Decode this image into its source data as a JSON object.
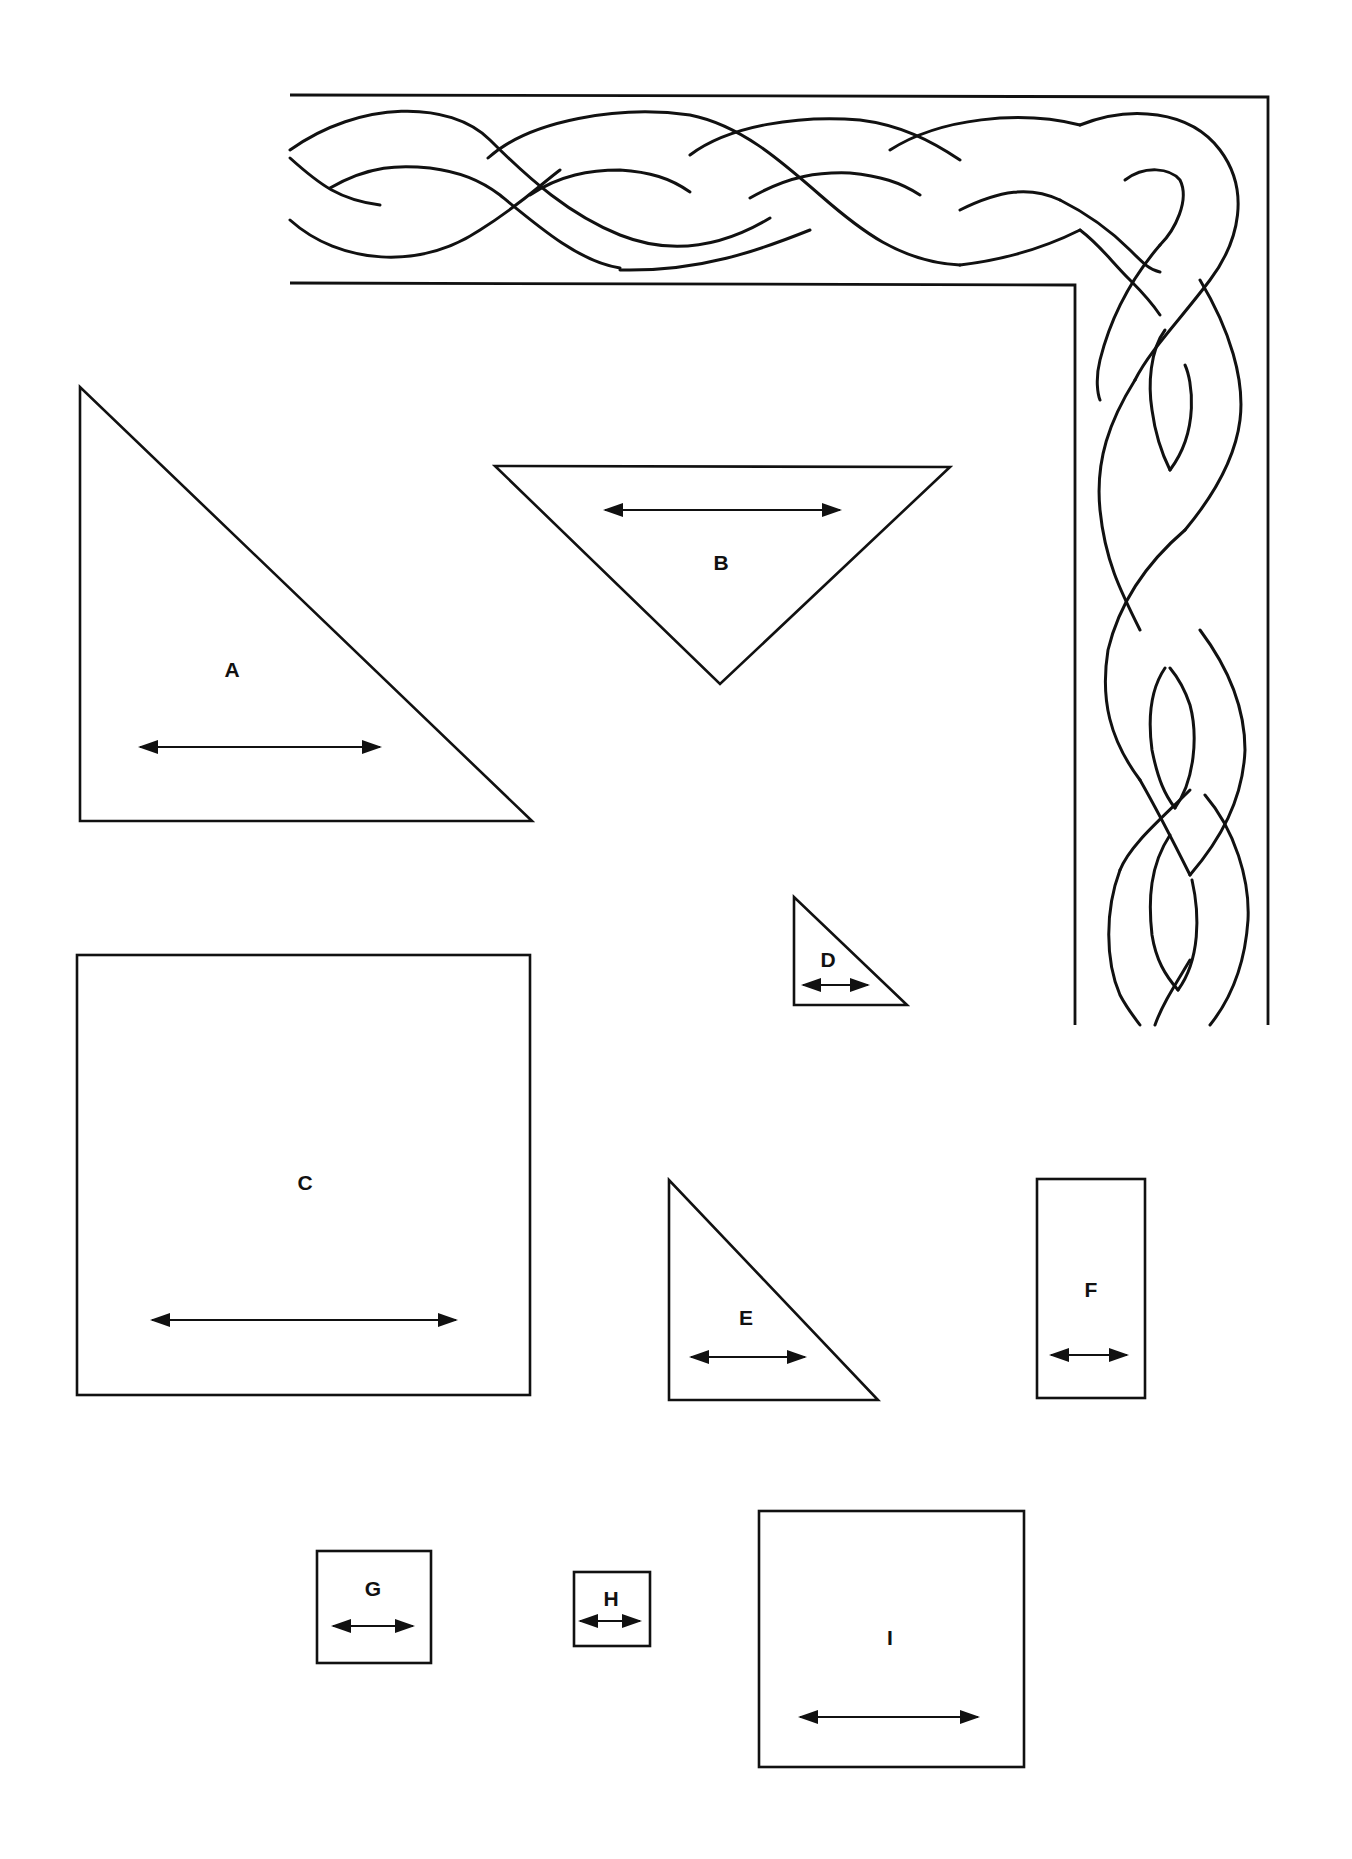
{
  "diagram": {
    "type": "quilt-pattern-templates",
    "border": {
      "name": "celtic-braid-corner-border",
      "description": "Two-strand interlaced braid running along top and down right side, turning at the top-right corner"
    },
    "colors": {
      "line": "#111111",
      "background": "#ffffff"
    },
    "pieces": [
      {
        "id": "A",
        "label": "A",
        "shape": "right-triangle",
        "grainline": "horizontal"
      },
      {
        "id": "B",
        "label": "B",
        "shape": "isosceles-right-triangle-inverted",
        "grainline": "horizontal"
      },
      {
        "id": "C",
        "label": "C",
        "shape": "square",
        "grainline": "horizontal"
      },
      {
        "id": "D",
        "label": "D",
        "shape": "right-triangle",
        "grainline": "horizontal"
      },
      {
        "id": "E",
        "label": "E",
        "shape": "right-triangle",
        "grainline": "horizontal"
      },
      {
        "id": "F",
        "label": "F",
        "shape": "rectangle",
        "grainline": "horizontal"
      },
      {
        "id": "G",
        "label": "G",
        "shape": "square",
        "grainline": "horizontal"
      },
      {
        "id": "H",
        "label": "H",
        "shape": "square",
        "grainline": "horizontal"
      },
      {
        "id": "I",
        "label": "I",
        "shape": "square",
        "grainline": "horizontal"
      }
    ]
  }
}
